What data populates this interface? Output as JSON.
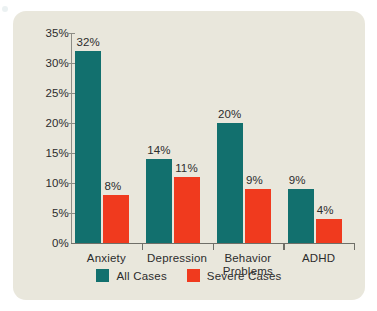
{
  "chart_data": {
    "type": "bar",
    "title": "",
    "subtitle": "",
    "xlabel": "",
    "ylabel": "",
    "categories": [
      "Anxiety",
      "Depression",
      "Behavior\nProblems",
      "ADHD"
    ],
    "series": [
      {
        "name": "All Cases",
        "color": "#12706e",
        "values": [
          32,
          14,
          20,
          9
        ],
        "labels": [
          "32%",
          "14%",
          "20%",
          "9%"
        ]
      },
      {
        "name": "Severe Cases",
        "color": "#f03a1e",
        "values": [
          8,
          11,
          9,
          4
        ],
        "labels": [
          "8%",
          "11%",
          "9%",
          "4%"
        ]
      }
    ],
    "ylim": [
      0,
      35
    ],
    "ytick_values": [
      0,
      5,
      10,
      15,
      20,
      25,
      30,
      35
    ],
    "ytick_labels": [
      "0%",
      "5%",
      "10%",
      "15%",
      "20%",
      "25%",
      "30%",
      "35%"
    ],
    "grid": false,
    "legend_position": "bottom"
  },
  "legend": {
    "items": [
      {
        "label": "All Cases",
        "color": "#12706e"
      },
      {
        "label": "Severe Cases",
        "color": "#f03a1e"
      }
    ]
  },
  "colors": {
    "panel_background": "#e9e7dc",
    "page_background": "#ffffff",
    "axis": "#8d8d86",
    "text": "#2c2c2c",
    "series_all_cases": "#12706e",
    "series_severe_cases": "#f03a1e"
  }
}
